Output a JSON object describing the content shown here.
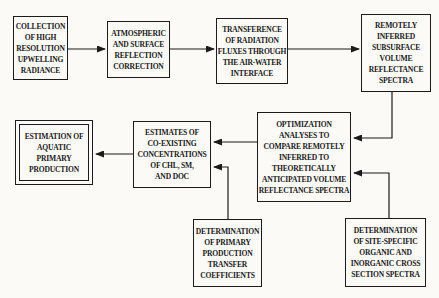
{
  "figure": {
    "type": "flowchart",
    "background_color": "#fbfaf7",
    "ink_color": "#1b1b1b",
    "nodes": [
      {
        "id": "upwelling-radiance",
        "label": "COLLECTION\nOF HIGH\nRESOLUTION\nUPWELLING\nRADIANCE"
      },
      {
        "id": "atmospheric-correction",
        "label": "ATMOSPHERIC\nAND SURFACE\nREFLECTION\nCORRECTION"
      },
      {
        "id": "radiation-transference",
        "label": "TRANSFERENCE\nOF RADIATION\nFLUXES THROUGH\nTHE AIR-WATER\nINTERFACE"
      },
      {
        "id": "volume-reflectance-spectra",
        "label": "REMOTELY\nINFERRED\nSUBSURFACE\nVOLUME\nREFLECTANCE\nSPECTRA"
      },
      {
        "id": "optimization-analyses",
        "label": "OPTIMIZATION\nANALYSES TO\nCOMPARE REMOTELY\nINFERRED TO\nTHEORETICALLY\nANTICIPATED VOLUME\nREFLECTANCE SPECTRA"
      },
      {
        "id": "coexisting-concentrations",
        "label": "ESTIMATES OF\nCO-EXISTING\nCONCENTRATIONS\nOF CHL, SM,\nAND DOC"
      },
      {
        "id": "aquatic-primary-production",
        "label": "ESTIMATION OF\nAQUATIC\nPRIMARY\nPRODUCTION"
      },
      {
        "id": "transfer-coefficients",
        "label": "DETERMINATION\nOF PRIMARY\nPRODUCTION\nTRANSFER\nCOEFFICIENTS"
      },
      {
        "id": "cross-section-spectra",
        "label": "DETERMINATION\nOF SITE-SPECIFIC\nORGANIC AND\nINORGANIC CROSS\nSECTION SPECTRA"
      }
    ],
    "connections": [
      {
        "from": "upwelling-radiance",
        "to": "atmospheric-correction"
      },
      {
        "from": "atmospheric-correction",
        "to": "radiation-transference"
      },
      {
        "from": "radiation-transference",
        "to": "volume-reflectance-spectra"
      },
      {
        "from": "volume-reflectance-spectra",
        "to": "optimization-analyses"
      },
      {
        "from": "cross-section-spectra",
        "to": "optimization-analyses"
      },
      {
        "from": "optimization-analyses",
        "to": "coexisting-concentrations"
      },
      {
        "from": "transfer-coefficients",
        "to": "coexisting-concentrations"
      },
      {
        "from": "coexisting-concentrations",
        "to": "aquatic-primary-production"
      }
    ]
  }
}
